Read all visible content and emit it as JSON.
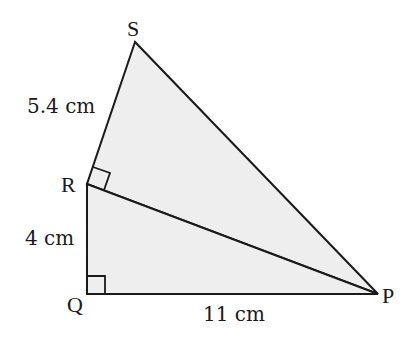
{
  "diagram": {
    "type": "geometry",
    "fill_color": "#eeeeee",
    "stroke_color": "#1a1a1a",
    "vertices": {
      "S": {
        "label": "S",
        "x": 135,
        "y": 42
      },
      "R": {
        "label": "R",
        "x": 87,
        "y": 184
      },
      "Q": {
        "label": "Q",
        "x": 87,
        "y": 294
      },
      "P": {
        "label": "P",
        "x": 378,
        "y": 294
      }
    },
    "right_angles": [
      "Q",
      "R"
    ],
    "measurements": {
      "RS": "5.4 cm",
      "QR": "4 cm",
      "QP": "11 cm"
    }
  }
}
